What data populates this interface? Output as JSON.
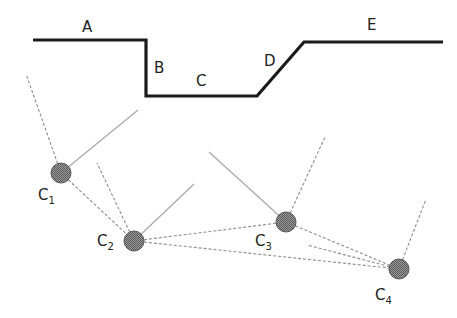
{
  "diagram": {
    "profile": {
      "points": [
        [
          33,
          40
        ],
        [
          146,
          40
        ],
        [
          146,
          96
        ],
        [
          257,
          96
        ],
        [
          304,
          42
        ],
        [
          443,
          42
        ]
      ],
      "color": "#1a1a1a",
      "segments": [
        {
          "label": "A",
          "x": 82,
          "y": 32
        },
        {
          "label": "B",
          "x": 154,
          "y": 73
        },
        {
          "label": "C",
          "x": 196,
          "y": 86
        },
        {
          "label": "D",
          "x": 264,
          "y": 66
        },
        {
          "label": "E",
          "x": 367,
          "y": 30
        }
      ]
    },
    "cameras": [
      {
        "id": "C1",
        "label": "C",
        "sub": "1",
        "cx": 61,
        "cy": 173,
        "r": 10,
        "label_x": 38,
        "label_y": 200
      },
      {
        "id": "C2",
        "label": "C",
        "sub": "2",
        "cx": 134,
        "cy": 241,
        "r": 10,
        "label_x": 97,
        "label_y": 246
      },
      {
        "id": "C3",
        "label": "C",
        "sub": "3",
        "cx": 286,
        "cy": 222,
        "r": 10,
        "label_x": 255,
        "label_y": 246
      },
      {
        "id": "C4",
        "label": "C",
        "sub": "4",
        "cx": 399,
        "cy": 269,
        "r": 10,
        "label_x": 375,
        "label_y": 300
      }
    ],
    "rays": [
      {
        "from": "C1",
        "x1": 61,
        "y1": 173,
        "x2": 26,
        "y2": 74,
        "style": "dash"
      },
      {
        "from": "C1",
        "x1": 61,
        "y1": 173,
        "x2": 138,
        "y2": 110,
        "style": "solid"
      },
      {
        "from": "C1",
        "x1": 61,
        "y1": 173,
        "x2": 134,
        "y2": 241,
        "style": "dash"
      },
      {
        "from": "C2",
        "x1": 134,
        "y1": 241,
        "x2": 97,
        "y2": 163,
        "style": "dash"
      },
      {
        "from": "C2",
        "x1": 134,
        "y1": 241,
        "x2": 194,
        "y2": 184,
        "style": "solid"
      },
      {
        "from": "C2",
        "x1": 134,
        "y1": 241,
        "x2": 286,
        "y2": 222,
        "style": "dash"
      },
      {
        "from": "C2",
        "x1": 134,
        "y1": 241,
        "x2": 399,
        "y2": 269,
        "style": "dash"
      },
      {
        "from": "C3",
        "x1": 286,
        "y1": 222,
        "x2": 209,
        "y2": 152,
        "style": "solid"
      },
      {
        "from": "C3",
        "x1": 286,
        "y1": 222,
        "x2": 325,
        "y2": 137,
        "style": "dash"
      },
      {
        "from": "C3",
        "x1": 286,
        "y1": 222,
        "x2": 399,
        "y2": 269,
        "style": "dash"
      },
      {
        "from": "C4",
        "x1": 399,
        "y1": 269,
        "x2": 307,
        "y2": 245,
        "style": "dash"
      },
      {
        "from": "C4",
        "x1": 399,
        "y1": 269,
        "x2": 426,
        "y2": 199,
        "style": "dash"
      }
    ]
  }
}
